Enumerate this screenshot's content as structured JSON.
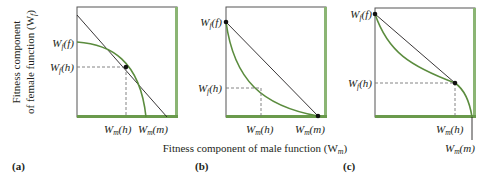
{
  "figure": {
    "y_axis_label_line1": "Fitness component",
    "y_axis_label_line2": "of female function (W",
    "y_axis_label_sub": "f",
    "y_axis_label_close": ")",
    "x_axis_label": "Fitness component of male function (W",
    "x_axis_label_sub": "m",
    "x_axis_label_close": ")",
    "colors": {
      "curve": "#5b8c3e",
      "frame_accent": "#8bb574",
      "line": "#231f20",
      "dash": "#777777"
    }
  },
  "panels": [
    {
      "letter": "(a)",
      "y_labels": [
        {
          "main": "W",
          "sub": "f",
          "arg": "(f)"
        },
        {
          "main": "W",
          "sub": "f",
          "arg": "(h)"
        }
      ],
      "x_labels": [
        {
          "main": "W",
          "sub": "m",
          "arg": "(h)"
        },
        {
          "main": "W",
          "sub": "m",
          "arg": "(m)"
        }
      ],
      "curve_shape": "concave"
    },
    {
      "letter": "(b)",
      "y_labels": [
        {
          "main": "W",
          "sub": "f",
          "arg": "(f)"
        },
        {
          "main": "W",
          "sub": "f",
          "arg": "(h)"
        }
      ],
      "x_labels": [
        {
          "main": "W",
          "sub": "m",
          "arg": "(h)"
        },
        {
          "main": "W",
          "sub": "m",
          "arg": "(m)"
        }
      ],
      "curve_shape": "convex"
    },
    {
      "letter": "(c)",
      "y_labels": [
        {
          "main": "W",
          "sub": "f",
          "arg": "(f)"
        },
        {
          "main": "W",
          "sub": "f",
          "arg": "(h)"
        }
      ],
      "x_labels": [
        {
          "main": "W",
          "sub": "m",
          "arg": "(h)"
        },
        {
          "main": "W",
          "sub": "m",
          "arg": "(m)"
        }
      ],
      "curve_shape": "sigmoid"
    }
  ]
}
